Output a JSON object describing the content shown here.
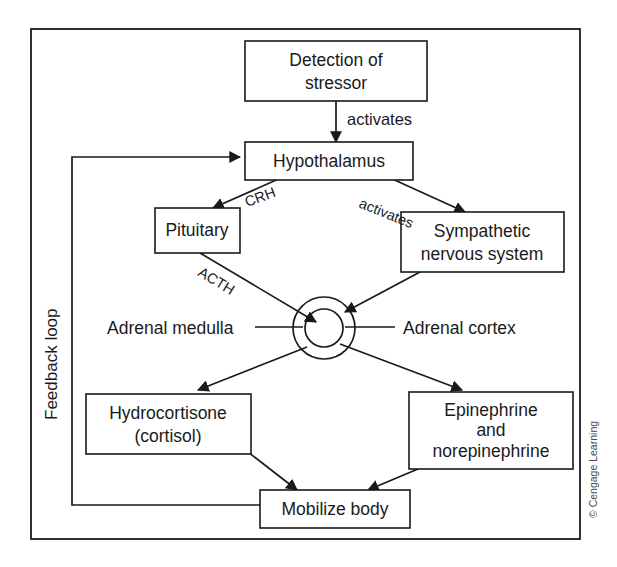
{
  "figure": {
    "credit": "© Cengage Learning",
    "feedback_loop_label": "Feedback loop",
    "stroke_color": "#1a1a1a",
    "background_color": "#ffffff"
  },
  "nodes": {
    "detection": {
      "line1": "Detection of",
      "line2": "stressor"
    },
    "hypothalamus": {
      "line1": "Hypothalamus"
    },
    "pituitary": {
      "line1": "Pituitary"
    },
    "sympathetic": {
      "line1": "Sympathetic",
      "line2": "nervous system"
    },
    "hydrocortisone": {
      "line1": "Hydrocortisone",
      "line2": "(cortisol)"
    },
    "epinephrine": {
      "line1": "Epinephrine",
      "line2": "and",
      "line3": "norepinephrine"
    },
    "mobilize": {
      "line1": "Mobilize body"
    }
  },
  "gland": {
    "medulla_label": "Adrenal medulla",
    "cortex_label": "Adrenal cortex"
  },
  "edges": {
    "detection_to_hypothalamus": "activates",
    "hypothalamus_to_pituitary": "CRH",
    "hypothalamus_to_sympathetic": "activates",
    "pituitary_to_cortex": "ACTH"
  }
}
